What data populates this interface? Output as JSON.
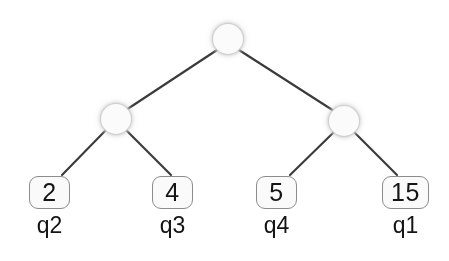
{
  "diagram": {
    "type": "binary-tree",
    "background_color": "#ffffff",
    "edge_color": "#3a3a3a",
    "node_fill_color": "#fbfbfb",
    "node_border_color": "#c6c6c6",
    "box_border_color": "#8c8c8c",
    "box_fill_color": "#fafafa",
    "text_color": "#151515",
    "internal_nodes": [
      {
        "id": "root",
        "cx": 228,
        "cy": 39,
        "r": 15
      },
      {
        "id": "left",
        "cx": 116,
        "cy": 119,
        "r": 15
      },
      {
        "id": "right",
        "cx": 344,
        "cy": 121,
        "r": 15
      }
    ],
    "edges": [
      {
        "from": "root",
        "to": "left",
        "x1": 217,
        "y1": 50,
        "x2": 126,
        "y2": 110
      },
      {
        "from": "root",
        "to": "right",
        "x1": 239,
        "y1": 50,
        "x2": 334,
        "y2": 111
      },
      {
        "from": "left",
        "to": "leaf-q2",
        "x1": 106,
        "y1": 130,
        "x2": 62,
        "y2": 175
      },
      {
        "from": "left",
        "to": "leaf-q3",
        "x1": 126,
        "y1": 130,
        "x2": 171,
        "y2": 175
      },
      {
        "from": "right",
        "to": "leaf-q4",
        "x1": 334,
        "y1": 132,
        "x2": 290,
        "y2": 175
      },
      {
        "from": "right",
        "to": "leaf-q1",
        "x1": 354,
        "y1": 132,
        "x2": 397,
        "y2": 175
      }
    ],
    "leaves": [
      {
        "value": "2",
        "label": "q2",
        "box_x": 29,
        "box_y": 176,
        "box_w": 41,
        "box_h": 33,
        "label_x": 29,
        "label_y": 214,
        "label_w": 41
      },
      {
        "value": "4",
        "label": "q3",
        "box_x": 152,
        "box_y": 176,
        "box_w": 41,
        "box_h": 33,
        "label_x": 152,
        "label_y": 214,
        "label_w": 41
      },
      {
        "value": "5",
        "label": "q4",
        "box_x": 256,
        "box_y": 176,
        "box_w": 41,
        "box_h": 33,
        "label_x": 256,
        "label_y": 214,
        "label_w": 41
      },
      {
        "value": "15",
        "label": "q1",
        "box_x": 382,
        "box_y": 176,
        "box_w": 47,
        "box_h": 33,
        "label_x": 382,
        "label_y": 214,
        "label_w": 47
      }
    ]
  }
}
